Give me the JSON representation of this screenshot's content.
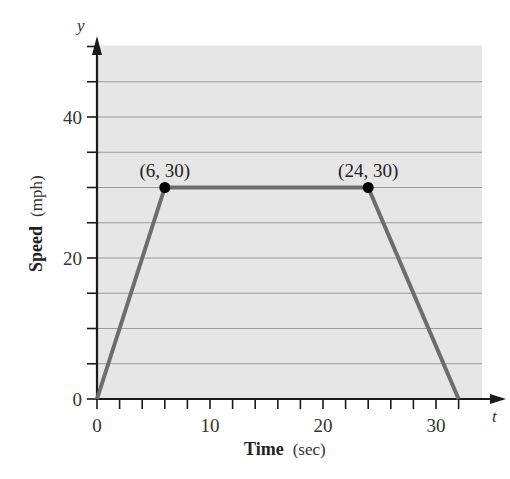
{
  "chart_data": {
    "type": "line",
    "title": "",
    "xlabel": "Time (sec)",
    "ylabel": "Speed (mph)",
    "x_axis_var": "t",
    "y_axis_var": "y",
    "xlim": [
      0,
      34
    ],
    "ylim": [
      0,
      50
    ],
    "x_ticks": [
      0,
      2,
      4,
      6,
      8,
      10,
      12,
      14,
      16,
      18,
      20,
      22,
      24,
      26,
      28,
      30,
      32
    ],
    "x_tick_labels": [
      "0",
      "10",
      "20",
      "30"
    ],
    "x_tick_label_values": [
      0,
      10,
      20,
      30
    ],
    "y_ticks": [
      0,
      5,
      10,
      15,
      20,
      25,
      30,
      35,
      40,
      45,
      50
    ],
    "y_tick_labels": [
      "0",
      "20",
      "40"
    ],
    "y_tick_label_values": [
      0,
      20,
      40
    ],
    "grid": true,
    "series": [
      {
        "name": "speed",
        "x": [
          0,
          6,
          24,
          32
        ],
        "y": [
          0,
          30,
          30,
          0
        ],
        "color": "#6d6d6d"
      }
    ],
    "annotations": [
      {
        "label": "(6, 30)",
        "x": 6,
        "y": 30
      },
      {
        "label": "(24, 30)",
        "x": 24,
        "y": 30
      }
    ]
  },
  "labels": {
    "y_var": "y",
    "t_var": "t",
    "x_title_bold": "Time",
    "x_title_unit": "(sec)",
    "y_title_bold": "Speed",
    "y_title_unit": "(mph)"
  },
  "colors": {
    "plot_bg": "#e6e6e6",
    "grid": "#9a9a9a",
    "line": "#6d6d6d",
    "axis": "#1a1a1a",
    "point": "#000000"
  }
}
